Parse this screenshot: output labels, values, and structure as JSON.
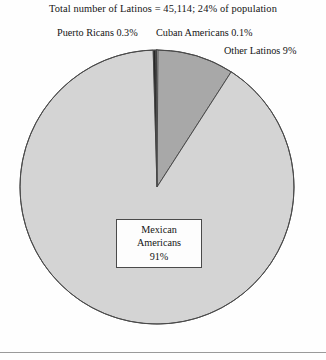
{
  "title": "Total number of Latinos = 45,114; 24% of population",
  "callouts": {
    "puerto_ricans": "Puerto Ricans 0.3%",
    "cuban_americans": "Cuban Americans 0.1%",
    "other_latinos": "Other Latinos 9%"
  },
  "center_label": {
    "line1": "Mexican",
    "line2": "Americans",
    "line3": "91%"
  },
  "colors": {
    "mexican_americans": "#d4d4d4",
    "other_latinos": "#a8a8a8",
    "puerto_ricans": "#262626",
    "cuban_americans": "#3d3d3d",
    "slice_outline": "#4a4a4a",
    "footer_rule": "#9a9a9a",
    "text": "#141414",
    "background": "#fefefe"
  },
  "chart_data": {
    "type": "pie",
    "title": "Total number of Latinos = 45,114; 24% of population",
    "total_label": "Total number of Latinos",
    "total_value": 45114,
    "share_of_population_percent": 24,
    "units": "percent",
    "start_angle_deg": 0,
    "direction": "clockwise",
    "legend_position": "callout-labels",
    "grid": false,
    "labels": [
      "Other Latinos",
      "Mexican Americans",
      "Puerto Ricans",
      "Cuban Americans"
    ],
    "values": [
      9,
      91,
      0.3,
      0.1
    ],
    "slices": [
      {
        "label": "Other Latinos",
        "value": 9,
        "display": "Other Latinos 9%",
        "color": "#a8a8a8",
        "start_deg": 0.4,
        "end_deg": 32.8
      },
      {
        "label": "Mexican Americans",
        "value": 91,
        "display": "Mexican Americans 91%",
        "color": "#d4d4d4",
        "start_deg": 32.8,
        "end_deg": 358.4
      },
      {
        "label": "Puerto Ricans",
        "value": 0.3,
        "display": "Puerto Ricans 0.3%",
        "color": "#262626",
        "start_deg": 358.4,
        "end_deg": 359.5
      },
      {
        "label": "Cuban Americans",
        "value": 0.1,
        "display": "Cuban Americans 0.1%",
        "color": "#3d3d3d",
        "start_deg": 359.5,
        "end_deg": 360.0
      }
    ],
    "annotations": [
      "Total number of Latinos = 45,114; 24% of population",
      "Puerto Ricans 0.3%",
      "Cuban Americans 0.1%",
      "Other Latinos 9%",
      "Mexican Americans 91%"
    ],
    "xlabel": "",
    "ylabel": ""
  }
}
